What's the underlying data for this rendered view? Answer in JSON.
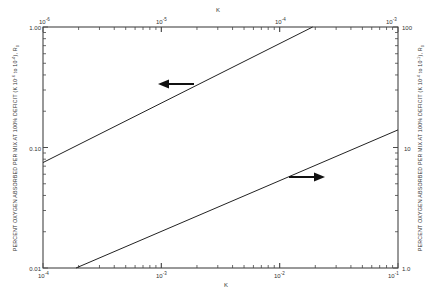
{
  "chart_data": {
    "type": "line",
    "title": "",
    "axes": {
      "bottom": {
        "label": "K",
        "scale": "log",
        "range": [
          0.0001,
          0.1
        ],
        "ticks": [
          "10^-4",
          "10^-3",
          "10^-2",
          "10^-1"
        ]
      },
      "top": {
        "label": "K",
        "scale": "log",
        "range": [
          1e-06,
          0.001
        ],
        "ticks": [
          "10^-6",
          "10^-5",
          "10^-4",
          "10^-3"
        ]
      },
      "left": {
        "label": "PERCENT OXYGEN ABSORBED PER MIX AT 100% DEFICIT (K 10^-6 to 10^-4), R0",
        "scale": "log",
        "range": [
          0.01,
          1.0
        ],
        "ticks": [
          "0.01",
          "0.10",
          "1.00"
        ]
      },
      "right": {
        "label": "PERCENT OXYGEN ABSORBED PER MIX AT 100% DEFICIT (K 10^-4 to 10^-1), R0",
        "scale": "log",
        "range": [
          1.0,
          100
        ],
        "ticks": [
          "1.0",
          "10",
          "100"
        ]
      }
    },
    "series": [
      {
        "name": "Low K range (read top & left axes)",
        "arrow": "left",
        "x_axis": "top",
        "y_axis": "left",
        "x": [
          1e-06,
          0.00019
        ],
        "y": [
          0.075,
          1.0
        ]
      },
      {
        "name": "High K range (read bottom & right axes)",
        "arrow": "right",
        "x_axis": "bottom",
        "y_axis": "right",
        "x": [
          0.00019,
          0.1
        ],
        "y": [
          1.0,
          14
        ]
      }
    ],
    "grid": false,
    "legend": "none"
  },
  "labels": {
    "top_axis_title": "K",
    "bottom_axis_title": "K",
    "top_ticks": [
      {
        "base": "10",
        "exp": "-6"
      },
      {
        "base": "10",
        "exp": "-5"
      },
      {
        "base": "10",
        "exp": "-4"
      },
      {
        "base": "10",
        "exp": "-3"
      }
    ],
    "bottom_ticks": [
      {
        "base": "10",
        "exp": "-4"
      },
      {
        "base": "10",
        "exp": "-3"
      },
      {
        "base": "10",
        "exp": "-2"
      },
      {
        "base": "10",
        "exp": "-1"
      }
    ],
    "left_ticks": [
      "1.00",
      "0.10",
      "0.01"
    ],
    "right_ticks": [
      "100",
      "10",
      "1.0"
    ],
    "left_ylabel": "PERCENT OXYGEN ABSORBED PER MIX AT 100% DEFICIT (K 10",
    "left_ylabel_exp1": "-6",
    "left_ylabel_mid": " to 10",
    "left_ylabel_exp2": "-4",
    "left_ylabel_end": "), R",
    "left_ylabel_sub": "0",
    "right_ylabel": "PERCENT OXYGEN ABSORBED PER MIX AT 100% DEFICIT (K 10",
    "right_ylabel_exp1": "-4",
    "right_ylabel_mid": " to 10",
    "right_ylabel_exp2": "-1",
    "right_ylabel_end": "), R",
    "right_ylabel_sub": "0"
  }
}
